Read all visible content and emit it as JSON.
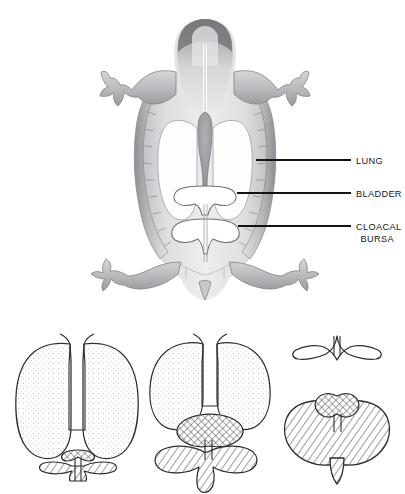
{
  "figure": {
    "background_color": "#ffffff",
    "ink_color": "#2b2d30",
    "label_color": "#17181a",
    "leader_color": "#111315"
  },
  "top_figure": {
    "name": "shaded-ventral-view",
    "description": "Shaded dorsal/ventral view of a turtle showing shell margin, head, fore and hind limbs with internal organ outlines",
    "shading_light": "#ededee",
    "shading_mid": "#c9c9ca",
    "shading_dark": "#8e8f92"
  },
  "labels": [
    {
      "id": "lung",
      "text": "LUNG",
      "lines": [
        "LUNG"
      ],
      "text_x": 356,
      "text_y": 163,
      "leader_x1": 256,
      "leader_x2": 351,
      "leader_y": 160
    },
    {
      "id": "bladder",
      "text": "BLADDER",
      "lines": [
        "BLADDER"
      ],
      "text_x": 356,
      "text_y": 196,
      "leader_x1": 237,
      "leader_x2": 351,
      "leader_y": 193
    },
    {
      "id": "cloacal-bursa",
      "text": "CLOACAL BURSA",
      "lines": [
        "CLOACAL",
        "BURSA"
      ],
      "text_x": 394,
      "text_y": 229,
      "leader_x1": 238,
      "leader_x2": 351,
      "leader_y": 226
    }
  ],
  "panels": [
    {
      "id": "panel-a",
      "position": "left",
      "description": "Fully inflated lungs with small collapsed bladder and cloacal bursae",
      "parts": [
        {
          "name": "left-lung",
          "fill_pattern": "stipple",
          "state": "inflated"
        },
        {
          "name": "right-lung",
          "fill_pattern": "stipple",
          "state": "inflated"
        },
        {
          "name": "trachea",
          "fill_pattern": "none",
          "state": "open"
        },
        {
          "name": "bladder",
          "fill_pattern": "crosshatch",
          "state": "empty"
        },
        {
          "name": "cloacal-bursae",
          "fill_pattern": "diagonal-hatch",
          "state": "empty"
        }
      ]
    },
    {
      "id": "panel-b",
      "position": "middle",
      "description": "Partly deflated lungs with partly filled bladder and cloacal bursae",
      "parts": [
        {
          "name": "left-lung",
          "fill_pattern": "stipple",
          "state": "partly-deflated"
        },
        {
          "name": "right-lung",
          "fill_pattern": "stipple",
          "state": "partly-deflated"
        },
        {
          "name": "trachea",
          "fill_pattern": "none",
          "state": "open"
        },
        {
          "name": "bladder",
          "fill_pattern": "crosshatch",
          "state": "partly-filled"
        },
        {
          "name": "cloacal-bursae",
          "fill_pattern": "diagonal-hatch",
          "state": "partly-filled"
        }
      ]
    },
    {
      "id": "panel-c",
      "position": "right",
      "description": "Collapsed lungs with fully distended cloacal bursae and small bladder",
      "parts": [
        {
          "name": "collapsed-lungs",
          "fill_pattern": "none",
          "state": "collapsed"
        },
        {
          "name": "bladder",
          "fill_pattern": "crosshatch",
          "state": "small"
        },
        {
          "name": "cloacal-bursae",
          "fill_pattern": "diagonal-hatch",
          "state": "distended"
        }
      ]
    }
  ]
}
